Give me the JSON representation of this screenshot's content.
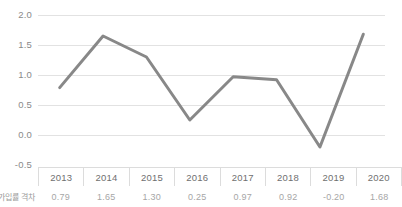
{
  "chart_data": {
    "type": "line",
    "title": "",
    "xlabel": "",
    "ylabel": "",
    "categories": [
      "2013",
      "2014",
      "2015",
      "2016",
      "2017",
      "2018",
      "2019",
      "2020"
    ],
    "values": [
      0.79,
      1.65,
      1.3,
      0.25,
      0.97,
      0.92,
      -0.2,
      1.68
    ],
    "value_labels": [
      "0.79",
      "1.65",
      "1.30",
      "0.25",
      "0.97",
      "0.92",
      "-0.20",
      "1.68"
    ],
    "series": [
      {
        "name": "가입률 격차",
        "values": [
          0.79,
          1.65,
          1.3,
          0.25,
          0.97,
          0.92,
          -0.2,
          1.68
        ],
        "color": "#888888"
      }
    ],
    "ylim": [
      -0.5,
      2.0
    ],
    "yticks": [
      2.0,
      1.5,
      1.0,
      0.5,
      0.0,
      -0.5
    ],
    "ytick_labels": [
      "2.0",
      "1.5",
      "1.0",
      "0.5",
      "0.0",
      "-0.5"
    ],
    "grid": true,
    "legend": "none",
    "data_table": {
      "row_label": "가입률 격차",
      "columns": [
        "2013",
        "2014",
        "2015",
        "2016",
        "2017",
        "2018",
        "2019",
        "2020"
      ],
      "values": [
        "0.79",
        "1.65",
        "1.30",
        "0.25",
        "0.97",
        "0.92",
        "-0.20",
        "1.68"
      ]
    }
  },
  "colors": {
    "line": "#888888",
    "gridline": "#e2e2e2",
    "axis_text": "#8a8a8a",
    "table_text": "#6f6f6f",
    "table_value_text": "#a6a6a6",
    "background": "#ffffff"
  }
}
